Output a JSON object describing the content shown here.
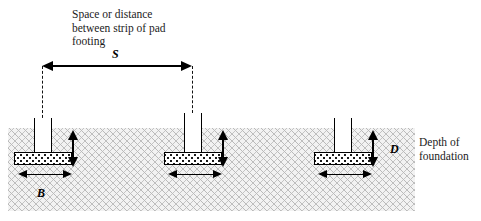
{
  "diagram": {
    "title_note": "Space or distance\nbetween strip of pad\nfooting",
    "depth_note": "Depth of\nfoundation",
    "symbols": {
      "spacing": "S",
      "width": "B",
      "depth": "D"
    },
    "footings": [
      {
        "label": "footing-left"
      },
      {
        "label": "footing-middle"
      },
      {
        "label": "footing-right"
      }
    ],
    "colors": {
      "ink": "#000000",
      "soil_fill": "#f2f2f2",
      "soil_hatch": "#b9b9b9",
      "pad_fill": "#ffffff",
      "background": "#ffffff"
    }
  }
}
